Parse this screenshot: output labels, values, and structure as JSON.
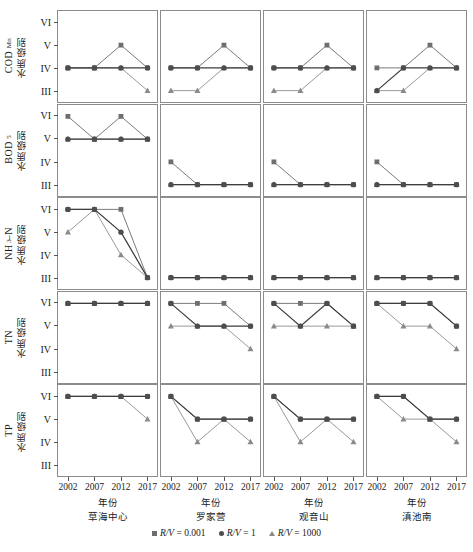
{
  "axes": {
    "y_ticks": [
      "VI",
      "V",
      "IV",
      "III"
    ],
    "y_order_bottom_to_top": [
      "III",
      "IV",
      "V",
      "VI"
    ],
    "x_ticks": [
      "2002",
      "2007",
      "2012",
      "2017"
    ],
    "x_title": "年份"
  },
  "rows": [
    {
      "key": "codmn",
      "latin": "COD",
      "sub": "Mn",
      "cjk": "水质级别"
    },
    {
      "key": "bod5",
      "latin": "BOD",
      "sub": "5",
      "cjk": "水质级别"
    },
    {
      "key": "nh3n",
      "latin": "NH",
      "sub": "3",
      "latin2": "–N",
      "cjk": "水质级别"
    },
    {
      "key": "tn",
      "latin": "TN",
      "sub": "",
      "cjk": "水质级别"
    },
    {
      "key": "tp",
      "latin": "TP",
      "sub": "",
      "cjk": "水质级别"
    }
  ],
  "columns": [
    {
      "key": "caohai",
      "label": "草海中心"
    },
    {
      "key": "luojiaying",
      "label": "罗家营"
    },
    {
      "key": "guanyinshan",
      "label": "观音山"
    },
    {
      "key": "dianchinan",
      "label": "滇池南"
    }
  ],
  "legend": [
    {
      "marker": "square-marker",
      "text": "R/V = 0.001",
      "var": "R/V",
      "eq": "= 0.001"
    },
    {
      "marker": "circle-marker",
      "text": "R/V = 1",
      "var": "R/V",
      "eq": "= 1"
    },
    {
      "marker": "triangle-marker",
      "text": "R/V = 1000",
      "var": "R/V",
      "eq": "= 1000"
    }
  ],
  "colors": {
    "square": "#6e6e6e",
    "circle": "#4d4d4d",
    "triangle": "#8a8a8a",
    "line_square": "#7a7a7a",
    "line_circle": "#3d3d3d",
    "line_triangle": "#9a9a9a",
    "panel_border": "#8c8c8c",
    "text": "#1a1a1a"
  },
  "chart_data": {
    "type": "line",
    "title": "",
    "xlabel": "年份",
    "ylabel": "水质级别",
    "x": [
      2002,
      2007,
      2012,
      2017
    ],
    "y_categories": [
      "III",
      "IV",
      "V",
      "VI"
    ],
    "grid": false,
    "legend_position": "bottom",
    "panel_rows": [
      "CODMn",
      "BOD5",
      "NH3-N",
      "TN",
      "TP"
    ],
    "panel_columns": [
      "草海中心",
      "罗家营",
      "观音山",
      "滇池南"
    ],
    "panels": [
      {
        "row": "CODMn",
        "column": "草海中心",
        "series": [
          {
            "name": "R/V = 0.001",
            "values": [
              "IV",
              "IV",
              "V",
              "IV"
            ]
          },
          {
            "name": "R/V = 1",
            "values": [
              "IV",
              "IV",
              "IV",
              "IV"
            ]
          },
          {
            "name": "R/V = 1000",
            "values": [
              "IV",
              "IV",
              "IV",
              "III"
            ]
          }
        ]
      },
      {
        "row": "CODMn",
        "column": "罗家营",
        "series": [
          {
            "name": "R/V = 0.001",
            "values": [
              "IV",
              "IV",
              "V",
              "IV"
            ]
          },
          {
            "name": "R/V = 1",
            "values": [
              "IV",
              "IV",
              "IV",
              "IV"
            ]
          },
          {
            "name": "R/V = 1000",
            "values": [
              "III",
              "III",
              "IV",
              "IV"
            ]
          }
        ]
      },
      {
        "row": "CODMn",
        "column": "观音山",
        "series": [
          {
            "name": "R/V = 0.001",
            "values": [
              "IV",
              "IV",
              "V",
              "IV"
            ]
          },
          {
            "name": "R/V = 1",
            "values": [
              "IV",
              "IV",
              "IV",
              "IV"
            ]
          },
          {
            "name": "R/V = 1000",
            "values": [
              "III",
              "III",
              "IV",
              "IV"
            ]
          }
        ]
      },
      {
        "row": "CODMn",
        "column": "滇池南",
        "series": [
          {
            "name": "R/V = 0.001",
            "values": [
              "IV",
              "IV",
              "V",
              "IV"
            ]
          },
          {
            "name": "R/V = 1",
            "values": [
              "III",
              "IV",
              "IV",
              "IV"
            ]
          },
          {
            "name": "R/V = 1000",
            "values": [
              "III",
              "III",
              "IV",
              "IV"
            ]
          }
        ]
      },
      {
        "row": "BOD5",
        "column": "草海中心",
        "series": [
          {
            "name": "R/V = 0.001",
            "values": [
              "VI",
              "V",
              "VI",
              "V"
            ]
          },
          {
            "name": "R/V = 1",
            "values": [
              "V",
              "V",
              "V",
              "V"
            ]
          },
          {
            "name": "R/V = 1000",
            "values": [
              "V",
              "V",
              "V",
              "V"
            ]
          }
        ]
      },
      {
        "row": "BOD5",
        "column": "罗家营",
        "series": [
          {
            "name": "R/V = 0.001",
            "values": [
              "IV",
              "III",
              "III",
              "III"
            ]
          },
          {
            "name": "R/V = 1",
            "values": [
              "III",
              "III",
              "III",
              "III"
            ]
          },
          {
            "name": "R/V = 1000",
            "values": [
              "III",
              "III",
              "III",
              "III"
            ]
          }
        ]
      },
      {
        "row": "BOD5",
        "column": "观音山",
        "series": [
          {
            "name": "R/V = 0.001",
            "values": [
              "IV",
              "III",
              "III",
              "III"
            ]
          },
          {
            "name": "R/V = 1",
            "values": [
              "III",
              "III",
              "III",
              "III"
            ]
          },
          {
            "name": "R/V = 1000",
            "values": [
              "III",
              "III",
              "III",
              "III"
            ]
          }
        ]
      },
      {
        "row": "BOD5",
        "column": "滇池南",
        "series": [
          {
            "name": "R/V = 0.001",
            "values": [
              "IV",
              "III",
              "III",
              "III"
            ]
          },
          {
            "name": "R/V = 1",
            "values": [
              "III",
              "III",
              "III",
              "III"
            ]
          },
          {
            "name": "R/V = 1000",
            "values": [
              "III",
              "III",
              "III",
              "III"
            ]
          }
        ]
      },
      {
        "row": "NH3-N",
        "column": "草海中心",
        "series": [
          {
            "name": "R/V = 0.001",
            "values": [
              "VI",
              "VI",
              "VI",
              "III"
            ]
          },
          {
            "name": "R/V = 1",
            "values": [
              "VI",
              "VI",
              "V",
              "III"
            ]
          },
          {
            "name": "R/V = 1000",
            "values": [
              "V",
              "VI",
              "IV",
              "III"
            ]
          }
        ]
      },
      {
        "row": "NH3-N",
        "column": "罗家营",
        "series": [
          {
            "name": "R/V = 0.001",
            "values": [
              "III",
              "III",
              "III",
              "III"
            ]
          },
          {
            "name": "R/V = 1",
            "values": [
              "III",
              "III",
              "III",
              "III"
            ]
          },
          {
            "name": "R/V = 1000",
            "values": [
              "III",
              "III",
              "III",
              "III"
            ]
          }
        ]
      },
      {
        "row": "NH3-N",
        "column": "观音山",
        "series": [
          {
            "name": "R/V = 0.001",
            "values": [
              "III",
              "III",
              "III",
              "III"
            ]
          },
          {
            "name": "R/V = 1",
            "values": [
              "III",
              "III",
              "III",
              "III"
            ]
          },
          {
            "name": "R/V = 1000",
            "values": [
              "III",
              "III",
              "III",
              "III"
            ]
          }
        ]
      },
      {
        "row": "NH3-N",
        "column": "滇池南",
        "series": [
          {
            "name": "R/V = 0.001",
            "values": [
              "III",
              "III",
              "III",
              "III"
            ]
          },
          {
            "name": "R/V = 1",
            "values": [
              "III",
              "III",
              "III",
              "III"
            ]
          },
          {
            "name": "R/V = 1000",
            "values": [
              "III",
              "III",
              "III",
              "III"
            ]
          }
        ]
      },
      {
        "row": "TN",
        "column": "草海中心",
        "series": [
          {
            "name": "R/V = 0.001",
            "values": [
              "VI",
              "VI",
              "VI",
              "VI"
            ]
          },
          {
            "name": "R/V = 1",
            "values": [
              "VI",
              "VI",
              "VI",
              "VI"
            ]
          },
          {
            "name": "R/V = 1000",
            "values": [
              "VI",
              "VI",
              "VI",
              "VI"
            ]
          }
        ]
      },
      {
        "row": "TN",
        "column": "罗家营",
        "series": [
          {
            "name": "R/V = 0.001",
            "values": [
              "VI",
              "VI",
              "VI",
              "V"
            ]
          },
          {
            "name": "R/V = 1",
            "values": [
              "VI",
              "V",
              "V",
              "V"
            ]
          },
          {
            "name": "R/V = 1000",
            "values": [
              "V",
              "V",
              "V",
              "IV"
            ]
          }
        ]
      },
      {
        "row": "TN",
        "column": "观音山",
        "series": [
          {
            "name": "R/V = 0.001",
            "values": [
              "VI",
              "VI",
              "VI",
              "V"
            ]
          },
          {
            "name": "R/V = 1",
            "values": [
              "VI",
              "V",
              "VI",
              "V"
            ]
          },
          {
            "name": "R/V = 1000",
            "values": [
              "V",
              "V",
              "V",
              "V"
            ]
          }
        ]
      },
      {
        "row": "TN",
        "column": "滇池南",
        "series": [
          {
            "name": "R/V = 0.001",
            "values": [
              "VI",
              "VI",
              "VI",
              "V"
            ]
          },
          {
            "name": "R/V = 1",
            "values": [
              "VI",
              "VI",
              "VI",
              "V"
            ]
          },
          {
            "name": "R/V = 1000",
            "values": [
              "VI",
              "V",
              "V",
              "IV"
            ]
          }
        ]
      },
      {
        "row": "TP",
        "column": "草海中心",
        "series": [
          {
            "name": "R/V = 0.001",
            "values": [
              "VI",
              "VI",
              "VI",
              "VI"
            ]
          },
          {
            "name": "R/V = 1",
            "values": [
              "VI",
              "VI",
              "VI",
              "VI"
            ]
          },
          {
            "name": "R/V = 1000",
            "values": [
              "VI",
              "VI",
              "VI",
              "V"
            ]
          }
        ]
      },
      {
        "row": "TP",
        "column": "罗家营",
        "series": [
          {
            "name": "R/V = 0.001",
            "values": [
              "VI",
              "V",
              "V",
              "V"
            ]
          },
          {
            "name": "R/V = 1",
            "values": [
              "VI",
              "V",
              "V",
              "V"
            ]
          },
          {
            "name": "R/V = 1000",
            "values": [
              "VI",
              "IV",
              "V",
              "IV"
            ]
          }
        ]
      },
      {
        "row": "TP",
        "column": "观音山",
        "series": [
          {
            "name": "R/V = 0.001",
            "values": [
              "VI",
              "V",
              "V",
              "V"
            ]
          },
          {
            "name": "R/V = 1",
            "values": [
              "VI",
              "V",
              "V",
              "V"
            ]
          },
          {
            "name": "R/V = 1000",
            "values": [
              "VI",
              "IV",
              "V",
              "IV"
            ]
          }
        ]
      },
      {
        "row": "TP",
        "column": "滇池南",
        "series": [
          {
            "name": "R/V = 0.001",
            "values": [
              "VI",
              "VI",
              "V",
              "V"
            ]
          },
          {
            "name": "R/V = 1",
            "values": [
              "VI",
              "VI",
              "V",
              "V"
            ]
          },
          {
            "name": "R/V = 1000",
            "values": [
              "VI",
              "V",
              "V",
              "IV"
            ]
          }
        ]
      }
    ]
  }
}
